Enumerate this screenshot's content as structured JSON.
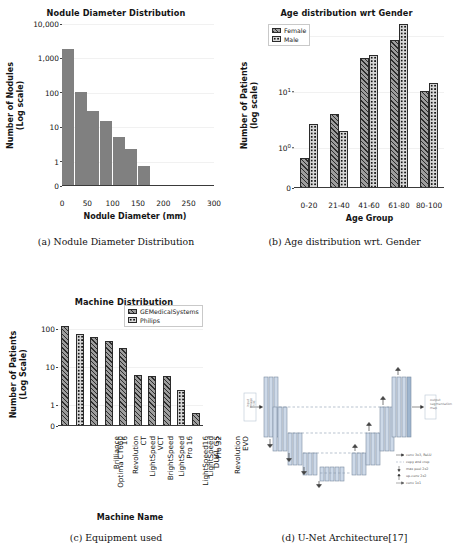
{
  "figure": {
    "panels": [
      {
        "key": "a",
        "caption": "(a) Nodule Diameter Distribution"
      },
      {
        "key": "b",
        "caption": "(b) Age distribution wrt. Gender"
      },
      {
        "key": "c",
        "caption": "(c) Equipment used"
      },
      {
        "key": "d",
        "caption": "(d) U-Net Architecture[17]"
      }
    ]
  },
  "chart_data": [
    {
      "type": "bar",
      "panel": "a",
      "title": "Nodule Diameter Distribution",
      "xlabel": "Nodule Diameter (mm)",
      "ylabel": "Number of Nodules\n(Log scale)",
      "ylabel_line1": "Number of Nodules",
      "ylabel_line2": "(Log scale)",
      "yscale": "log",
      "ytick_labels": [
        "10,000",
        "1,000",
        "100",
        "10",
        "1",
        "0"
      ],
      "ytick_values": [
        10000,
        1000,
        100,
        10,
        1,
        0
      ],
      "xtick_labels": [
        "0",
        "50",
        "100",
        "150",
        "200",
        "250",
        "300"
      ],
      "xtick_values": [
        0,
        50,
        100,
        150,
        200,
        250,
        300
      ],
      "xlim": [
        0,
        300
      ],
      "bin_edges": [
        0,
        25,
        50,
        75,
        100,
        125,
        150,
        175,
        200,
        250,
        280
      ],
      "categories": [
        "0-25",
        "25-50",
        "50-75",
        "75-100",
        "100-125",
        "125-150",
        "150-175",
        "175-200",
        "250-280"
      ],
      "values": [
        10000,
        550,
        160,
        80,
        27,
        12,
        4,
        0,
        1
      ],
      "bar_fill": "solid-gray",
      "grid": true,
      "legend": null
    },
    {
      "type": "bar",
      "panel": "b",
      "title": "Age distribution wrt Gender",
      "xlabel": "Age Group",
      "ylabel": "Number of Patients\n(log scale)",
      "ylabel_line1": "Number of Patients",
      "ylabel_line2": "(log scale)",
      "yscale": "log",
      "ytick_labels": [
        "10",
        "10",
        "10",
        "0"
      ],
      "ytick_exponents": [
        "2",
        "1",
        "0",
        ""
      ],
      "ytick_values": [
        100,
        10,
        1,
        0
      ],
      "categories": [
        "0-20",
        "21-40",
        "41-60",
        "61-80",
        "80-100"
      ],
      "series": [
        {
          "name": "Female",
          "fill": "hatch",
          "values": [
            1,
            6,
            62,
            130,
            16
          ]
        },
        {
          "name": "Male",
          "fill": "dots",
          "values": [
            4,
            3,
            70,
            250,
            22
          ]
        }
      ],
      "legend": {
        "position": "upper-left",
        "entries": [
          "Female",
          "Male"
        ]
      },
      "grid": true
    },
    {
      "type": "bar",
      "panel": "c",
      "title": "Machine Distribution",
      "xlabel": "Machine Name",
      "ylabel": "Number of Patients\n(Log Scale)",
      "ylabel_line1": "Number of Patients",
      "ylabel_line2": "(Log Scale)",
      "yscale": "log",
      "ytick_labels": [
        "100",
        "10",
        "1",
        "0"
      ],
      "ytick_values": [
        100,
        10,
        1,
        0
      ],
      "categories": [
        "Optima CT660",
        "Brilliance 16",
        "Revolution CT",
        "LightSpeed VCT",
        "BrightSpeed",
        "LightSpeed Pro 16",
        "LightSpeed16",
        "LightSpeed Pro 32",
        "DUAL GS",
        "Revolution EVO"
      ],
      "category_lines": [
        [
          "Optima CT660"
        ],
        [
          "Brilliance",
          "16"
        ],
        [
          "Revolution",
          "CT"
        ],
        [
          "LightSpeed",
          "VCT"
        ],
        [
          "BrightSpeed"
        ],
        [
          "LightSpeed",
          "Pro 16"
        ],
        [
          "LightSpeed16"
        ],
        [
          "LightSpeed",
          "Pro 32"
        ],
        [
          "DUAL GS"
        ],
        [
          "Revolution",
          "EVO"
        ]
      ],
      "values": [
        200,
        120,
        100,
        80,
        50,
        10,
        9.5,
        9.5,
        4,
        1
      ],
      "manufacturer": [
        "GEMedicalSystems",
        "Philips",
        "GEMedicalSystems",
        "GEMedicalSystems",
        "GEMedicalSystems",
        "GEMedicalSystems",
        "GEMedicalSystems",
        "GEMedicalSystems",
        "Philips",
        "GEMedicalSystems"
      ],
      "legend": {
        "position": "upper-right",
        "entries": [
          "GEMedicalSystems",
          "Philips"
        ]
      },
      "grid": true
    }
  ],
  "unet": {
    "title": "U-Net Architecture",
    "input_label": "input\nimage\ntile",
    "input_label_lines": [
      "input",
      "image",
      "tile"
    ],
    "output_label_lines": [
      "output",
      "segmentation",
      "map"
    ],
    "legend": [
      "conv 3x3, ReLU",
      "copy and crop",
      "max pool 2x2",
      "up-conv 2x2",
      "conv 1x1"
    ]
  },
  "colors": {
    "bar_gray": "#808080",
    "hatch_base": "#9d9d9d",
    "dots_base": "#d8d8d8",
    "axis": "#3a3a3a",
    "grid": "#f1f1f1",
    "text": "#141414",
    "unet_block": "#c8d6e8",
    "unet_outline": "#6b6b6b"
  }
}
